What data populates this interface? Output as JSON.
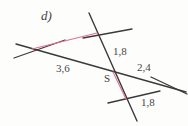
{
  "figure": {
    "part_label": "d)",
    "point_label": "S",
    "background_color": "#fdfdfc",
    "line_color": "#3a3a3a",
    "highlight_color": "#e0708f",
    "text_color": "#474747"
  },
  "measurements": [
    {
      "id": "len-36",
      "value": "3,6",
      "segment": "left-to-S on long transversal"
    },
    {
      "id": "len-18-top",
      "value": "1,8",
      "segment": "upper intersection to S on steep line"
    },
    {
      "id": "len-24",
      "value": "2,4",
      "segment": "S to right intersection on long transversal"
    },
    {
      "id": "len-18-bottom",
      "value": "1,8",
      "segment": "lower intersection to right intersection"
    }
  ],
  "geometry": {
    "description": "Two pairs of intersecting straight lines forming similar triangles about centre point S",
    "points": {
      "S": {
        "x": 111,
        "y": 70
      },
      "left_vertex": {
        "x": 32,
        "y": 48
      },
      "top_vertex": {
        "x": 97,
        "y": 33
      },
      "bottom_vertex": {
        "x": 125,
        "y": 98
      },
      "right_vertex": {
        "x": 171,
        "y": 86
      }
    },
    "lines": [
      {
        "name": "long-transversal",
        "x1": 16,
        "y1": 44,
        "x2": 186,
        "y2": 92
      },
      {
        "name": "steep-line",
        "x1": 89,
        "y1": 13,
        "x2": 137,
        "y2": 121
      },
      {
        "name": "short-upper-line",
        "x1": 18,
        "y1": 57,
        "x2": 63,
        "y2": 41
      },
      {
        "name": "upper-cross-line",
        "x1": 84,
        "y1": 38,
        "x2": 131,
        "y2": 29
      },
      {
        "name": "lower-cross-line",
        "x1": 109,
        "y1": 102,
        "x2": 159,
        "y2": 91
      },
      {
        "name": "right-cross-line",
        "x1": 152,
        "y1": 77,
        "x2": 187,
        "y2": 93
      }
    ],
    "highlight_segments": [
      {
        "name": "upper-pink-chord",
        "x1": 32,
        "y1": 49,
        "x2": 97,
        "y2": 33
      },
      {
        "name": "lower-pink-chord",
        "x1": 113,
        "y1": 72,
        "x2": 126,
        "y2": 99
      }
    ]
  }
}
